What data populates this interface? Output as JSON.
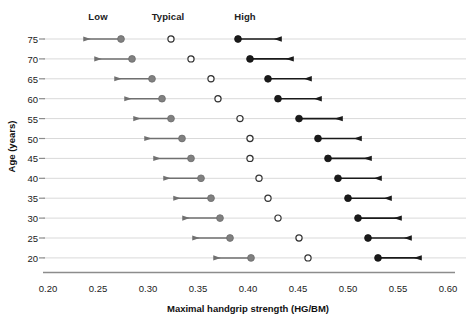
{
  "chart_data": {
    "type": "scatter",
    "title": "",
    "xlabel": "Maximal handgrip strength (HG/BM)",
    "ylabel": "Age (years)",
    "xlim": [
      0.2,
      0.6
    ],
    "xticks": [
      "0.20",
      "0.25",
      "0.30",
      "0.35",
      "0.40",
      "0.45",
      "0.50",
      "0.55",
      "0.60"
    ],
    "xtick_values": [
      0.2,
      0.25,
      0.3,
      0.35,
      0.4,
      0.45,
      0.5,
      0.55,
      0.6
    ],
    "categories": [
      75,
      70,
      65,
      60,
      55,
      50,
      45,
      40,
      35,
      30,
      25,
      20
    ],
    "ytick_labels": [
      "75",
      "70",
      "65",
      "60",
      "55",
      "50",
      "45",
      "40",
      "35",
      "30",
      "25",
      "20"
    ],
    "grid": true,
    "legend_position": "top",
    "column_headers": [
      {
        "label": "Low",
        "x": 0.27
      },
      {
        "label": "Typical",
        "x": 0.34
      },
      {
        "label": "High",
        "x": 0.417
      }
    ],
    "series": [
      {
        "name": "Low",
        "marker": "filled-circle",
        "color": "#808080",
        "arrow_direction": "left",
        "arrow_span": 0.037,
        "values": [
          0.273,
          0.284,
          0.304,
          0.314,
          0.323,
          0.334,
          0.343,
          0.353,
          0.363,
          0.372,
          0.382,
          0.403
        ]
      },
      {
        "name": "Typical",
        "marker": "open-circle",
        "color": "#ffffff",
        "edge_color": "#333333",
        "arrow_direction": "none",
        "arrow_span": 0,
        "values": [
          0.323,
          0.343,
          0.363,
          0.37,
          0.392,
          0.402,
          0.402,
          0.411,
          0.42,
          0.43,
          0.451,
          0.46
        ]
      },
      {
        "name": "High",
        "marker": "filled-circle",
        "color": "#1a1a1a",
        "arrow_direction": "right",
        "arrow_span": 0.043,
        "values": [
          0.39,
          0.402,
          0.42,
          0.43,
          0.451,
          0.47,
          0.48,
          0.49,
          0.5,
          0.51,
          0.52,
          0.53
        ]
      }
    ]
  },
  "colors": {
    "low": "#808080",
    "typical_edge": "#333333",
    "high": "#1a1a1a",
    "grid": "#d9d9d9",
    "axis": "#8c8c8c",
    "background": "#ffffff"
  }
}
